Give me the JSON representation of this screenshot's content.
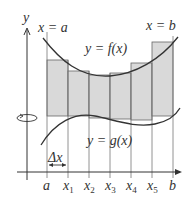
{
  "diagram": {
    "colors": {
      "fill": "#d9d9d9",
      "stroke": "#333333",
      "line": "#555555"
    },
    "axis_labels": {
      "y": "y"
    },
    "bounds": {
      "left": "x = a",
      "right": "x = b"
    },
    "curves": {
      "top": "y = f(x)",
      "bottom": "y = g(x)"
    },
    "delta": "Δx",
    "ticks": [
      {
        "main": "a",
        "sub": ""
      },
      {
        "main": "x",
        "sub": "1"
      },
      {
        "main": "x",
        "sub": "2"
      },
      {
        "main": "x",
        "sub": "3"
      },
      {
        "main": "x",
        "sub": "4"
      },
      {
        "main": "x",
        "sub": "5"
      },
      {
        "main": "b",
        "sub": ""
      }
    ],
    "rotation_icon": "rotation-arrow"
  }
}
